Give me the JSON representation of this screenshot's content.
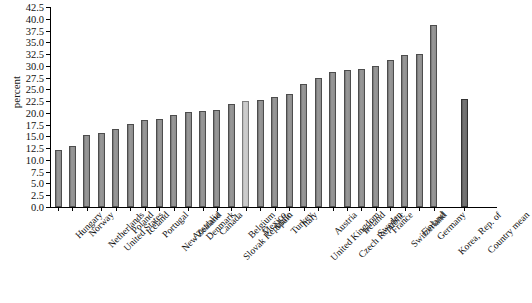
{
  "chart_data": {
    "type": "bar",
    "title": "",
    "xlabel": "",
    "ylabel": "percent",
    "ylim": [
      0,
      42.5
    ],
    "yticks": [
      "0.0",
      "2.5",
      "5.0",
      "7.5",
      "10.0",
      "12.5",
      "15.0",
      "17.5",
      "20.0",
      "22.5",
      "25.0",
      "27.5",
      "30.0",
      "32.5",
      "35.0",
      "37.5",
      "40.0",
      "42.5"
    ],
    "grid": false,
    "legend": "none",
    "categories": [
      "Hungary",
      "Norway",
      "Netherlands",
      "United States",
      "Poland",
      "Iceland",
      "Portugal",
      "New Zealand",
      "Australia",
      "Denmark",
      "Canada",
      "Slovak Republic",
      "Belgium",
      "Mexico",
      "Spain",
      "Turkey",
      "Italy",
      "United Kingdom",
      "Austria",
      "Czech Republic",
      "Ireland",
      "Sweden",
      "France",
      "Switzerland",
      "Finland",
      "Germany",
      "Korea, Rep. of",
      "Country mean"
    ],
    "values": [
      12.1,
      13.0,
      15.2,
      15.7,
      16.5,
      17.6,
      18.5,
      18.7,
      19.6,
      20.2,
      20.5,
      20.6,
      21.8,
      22.6,
      22.7,
      23.3,
      24.0,
      26.2,
      27.5,
      28.7,
      29.2,
      29.4,
      30.0,
      31.3,
      32.3,
      32.6,
      38.7,
      23.0
    ],
    "highlight_index": 13,
    "mean_index": 27,
    "colors": {
      "bar": "#8a8a8a",
      "bar_border": "#4d4d4d",
      "highlight": "#c4c4c4",
      "mean": "#6a6a6a",
      "axis": "#000000",
      "background": "#ffffff",
      "text": "#111111"
    }
  }
}
